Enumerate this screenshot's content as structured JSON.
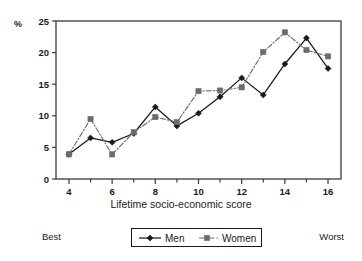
{
  "chart_data": {
    "type": "line",
    "title": "",
    "xlabel": "Lifetime socio-economic score",
    "ylabel": "%",
    "x": [
      4,
      5,
      6,
      7,
      8,
      9,
      10,
      11,
      12,
      13,
      14,
      15,
      16
    ],
    "xlim": [
      3.4,
      16.6
    ],
    "ylim": [
      0,
      25
    ],
    "xticks": [
      4,
      5,
      6,
      7,
      8,
      9,
      10,
      11,
      12,
      13,
      14,
      15,
      16
    ],
    "xtick_labels": [
      "4",
      "",
      "6",
      "",
      "8",
      "",
      "10",
      "",
      "12",
      "",
      "14",
      "",
      "16"
    ],
    "yticks": [
      0,
      5,
      10,
      15,
      20,
      25
    ],
    "ytick_labels": [
      "0",
      "5",
      "10",
      "15",
      "20",
      "25"
    ],
    "grid": false,
    "legend_position": "bottom-center",
    "series": [
      {
        "name": "Men",
        "marker": "diamond",
        "linestyle": "solid",
        "color": "#1a1a1a",
        "values": [
          3.9,
          6.5,
          5.8,
          7.2,
          11.4,
          8.4,
          10.4,
          13.0,
          16.0,
          13.3,
          18.2,
          22.3,
          17.5
        ]
      },
      {
        "name": "Women",
        "marker": "square",
        "linestyle": "dash-dot",
        "color": "#6b6b6b",
        "values": [
          3.9,
          9.5,
          3.9,
          7.4,
          9.8,
          9.0,
          13.9,
          14.0,
          14.5,
          20.1,
          23.2,
          20.4,
          19.4
        ]
      }
    ],
    "annotations": {
      "axis_left_note": "Best",
      "axis_right_note": "Worst"
    }
  },
  "legend": {
    "items": [
      {
        "label": "Men"
      },
      {
        "label": "Women"
      }
    ]
  },
  "colors": {
    "men": "#1a1a1a",
    "women": "#6b6b6b",
    "frame": "#3a3a3a",
    "background": "#ffffff"
  }
}
